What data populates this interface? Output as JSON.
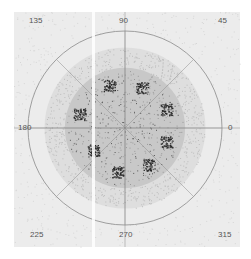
{
  "chart_data": {
    "type": "scatter",
    "subtype": "polar",
    "title": "",
    "angle_labels": [
      "0",
      "45",
      "90",
      "135",
      "180",
      "225",
      "270",
      "315"
    ],
    "angle_ticks_deg": [
      0,
      45,
      90,
      135,
      180,
      225,
      270,
      315
    ],
    "radial_rings": [
      {
        "name": "inner-disk",
        "r_frac": 0.62,
        "fill": "#c8c8c8"
      },
      {
        "name": "middle-annulus",
        "r_frac": 0.83,
        "fill": "#dedede"
      },
      {
        "name": "outer-circle",
        "r_frac": 1.0,
        "fill": "#ececec"
      }
    ],
    "clusters": [
      {
        "angle_deg": 24,
        "r_frac": 0.47
      },
      {
        "angle_deg": 67,
        "r_frac": 0.45
      },
      {
        "angle_deg": 110,
        "r_frac": 0.47
      },
      {
        "angle_deg": 163,
        "r_frac": 0.49
      },
      {
        "angle_deg": 215,
        "r_frac": 0.4
      },
      {
        "angle_deg": 261,
        "r_frac": 0.46
      },
      {
        "angle_deg": 303,
        "r_frac": 0.45
      },
      {
        "angle_deg": 342,
        "r_frac": 0.45
      }
    ],
    "grid": true,
    "legend": "none"
  },
  "colors": {
    "frame_bg": "#ececec",
    "gridline": "#8a8a8a",
    "inner_disk": "#c4c4c4",
    "cluster": "#2a2a2a",
    "label": "#555555"
  }
}
